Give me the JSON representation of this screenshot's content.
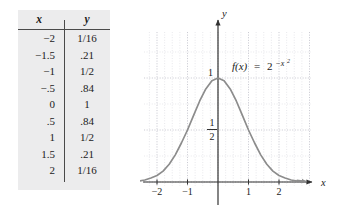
{
  "figure": {
    "background": "#ffffff",
    "panel_fill": "#ececed"
  },
  "table": {
    "headers": {
      "x": "x",
      "y": "y"
    },
    "rows": [
      {
        "x": "−2",
        "y": "1/16"
      },
      {
        "x": "−1.5",
        "y": ".21"
      },
      {
        "x": "−1",
        "y": "1/2"
      },
      {
        "x": "−.5",
        "y": ".84"
      },
      {
        "x": "0",
        "y": "1"
      },
      {
        "x": ".5",
        "y": ".84"
      },
      {
        "x": "1",
        "y": "1/2"
      },
      {
        "x": "1.5",
        "y": ".21"
      },
      {
        "x": "2",
        "y": "1/16"
      }
    ]
  },
  "chart_data": {
    "type": "line",
    "title": "",
    "function_label": {
      "lhs": "f(x)",
      "equals": "=",
      "base": "2",
      "exponent": "−x",
      "exponent_power": "2"
    },
    "xlabel": "x",
    "ylabel": "y",
    "xlim": [
      -2.85,
      2.85
    ],
    "ylim": [
      -0.18,
      1.32
    ],
    "x_ticks": [
      "−2",
      "−1",
      "1",
      "2"
    ],
    "x_tick_values": [
      -2,
      -1,
      1,
      2
    ],
    "y_ticks": [
      "1"
    ],
    "y_tick_values": [
      1
    ],
    "y_fraction_label": {
      "numerator": "1",
      "denominator": "2",
      "value": 0.5
    },
    "grid": true,
    "grid_style": "dotted",
    "legend": "none",
    "curve_color": "#8c8c8c",
    "axis_color": "#333333",
    "grid_color": "#c9c9cf",
    "x": [
      -2.8,
      -2.6,
      -2.4,
      -2.2,
      -2.0,
      -1.8,
      -1.6,
      -1.4,
      -1.2,
      -1.0,
      -0.8,
      -0.6,
      -0.4,
      -0.2,
      0.0,
      0.2,
      0.4,
      0.6,
      0.8,
      1.0,
      1.2,
      1.4,
      1.6,
      1.8,
      2.0,
      2.2,
      2.4,
      2.6,
      2.8
    ],
    "y": [
      0.004,
      0.009,
      0.019,
      0.039,
      0.063,
      0.105,
      0.171,
      0.261,
      0.375,
      0.5,
      0.641,
      0.779,
      0.895,
      0.973,
      1.0,
      0.973,
      0.895,
      0.779,
      0.641,
      0.5,
      0.375,
      0.261,
      0.171,
      0.105,
      0.063,
      0.039,
      0.019,
      0.009,
      0.004
    ]
  }
}
